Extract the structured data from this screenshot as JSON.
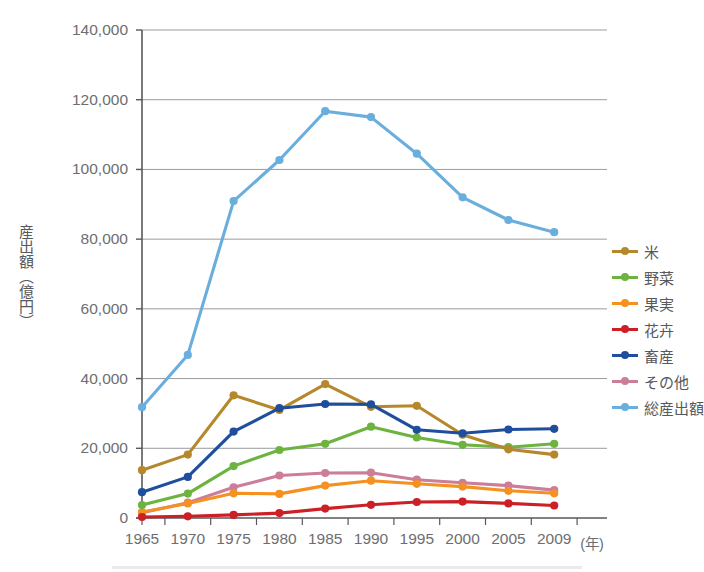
{
  "axes": {
    "y_title": "産出額（億円）",
    "y_tick_labels": [
      "140,000",
      "120,000",
      "100,000",
      "80,000",
      "60,000",
      "40,000",
      "20,000",
      "0"
    ],
    "x_tick_labels": [
      "1965",
      "1970",
      "1975",
      "1980",
      "1985",
      "1990",
      "1995",
      "2000",
      "2005",
      "2009"
    ],
    "x_unit_label": "(年)"
  },
  "legend": {
    "position": "right",
    "items": [
      {
        "label": "米",
        "color": "#b5892b"
      },
      {
        "label": "野菜",
        "color": "#6cb33f"
      },
      {
        "label": "果実",
        "color": "#f59120"
      },
      {
        "label": "花卉",
        "color": "#cc2027"
      },
      {
        "label": "畜産",
        "color": "#1f4e9c"
      },
      {
        "label": "その他",
        "color": "#cc7d99"
      },
      {
        "label": "総産出額",
        "color": "#6aaede"
      }
    ]
  },
  "colors": {
    "rice": "#b5892b",
    "vegetables": "#6cb33f",
    "fruits": "#f59120",
    "flowers": "#cc2027",
    "livestock": "#1f4e9c",
    "other": "#cc7d99",
    "total": "#6aaede",
    "gridline": "#9a9b9e",
    "axis": "#58595b",
    "text": "#6d6e70"
  },
  "chart_data": {
    "type": "line",
    "title": "",
    "subtitle": "",
    "xlabel": "(年)",
    "ylabel": "産出額（億円）",
    "x": [
      1965,
      1970,
      1975,
      1980,
      1985,
      1990,
      1995,
      2000,
      2005,
      2009
    ],
    "xtick_labels": [
      "1965",
      "1970",
      "1975",
      "1980",
      "1985",
      "1990",
      "1995",
      "2000",
      "2005",
      "2009"
    ],
    "ylim": [
      0,
      140000
    ],
    "ytick_values": [
      0,
      20000,
      40000,
      60000,
      80000,
      100000,
      120000,
      140000
    ],
    "grid": true,
    "legend_position": "right",
    "series": [
      {
        "name": "米",
        "color": "#b5892b",
        "values": [
          13700,
          18200,
          35200,
          31000,
          38400,
          31900,
          32200,
          23900,
          19700,
          18200
        ]
      },
      {
        "name": "野菜",
        "color": "#6cb33f",
        "values": [
          3700,
          7000,
          14900,
          19500,
          21300,
          26200,
          23100,
          21000,
          20300,
          21300
        ]
      },
      {
        "name": "果実",
        "color": "#f59120",
        "values": [
          1700,
          4200,
          7100,
          6900,
          9300,
          10700,
          9800,
          9000,
          7800,
          7100
        ]
      },
      {
        "name": "花卉",
        "color": "#cc2027",
        "values": [
          300,
          500,
          900,
          1400,
          2700,
          3800,
          4600,
          4700,
          4200,
          3600
        ]
      },
      {
        "name": "畜産",
        "color": "#1f4e9c",
        "values": [
          7400,
          11800,
          24800,
          31500,
          32700,
          32600,
          25300,
          24300,
          25400,
          25600
        ]
      },
      {
        "name": "その他",
        "color": "#cc7d99",
        "values": [
          1500,
          4400,
          8800,
          12200,
          12900,
          13000,
          11000,
          10100,
          9300,
          8000
        ]
      },
      {
        "name": "総産出額",
        "color": "#6aaede",
        "values": [
          31800,
          46800,
          90900,
          102700,
          116700,
          115000,
          104500,
          92000,
          85500,
          82000
        ]
      }
    ]
  }
}
